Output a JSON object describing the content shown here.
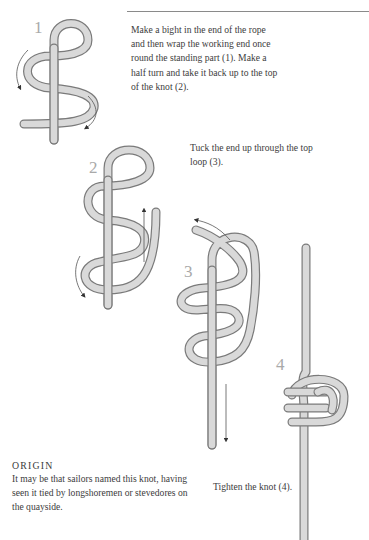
{
  "instructions": {
    "step_1_2": "Make a bight in the end of the rope and then wrap the working end once round the standing part (1). Make a half turn and take it back up to the top of the knot (2).",
    "step_3": "Tuck the end up through the top loop (3).",
    "step_4": "Tighten the knot (4)."
  },
  "origin": {
    "title": "ORIGIN",
    "body": "It may be that sailors named this knot, having seen it tied by longshoremen or stevedores on the quayside."
  },
  "diagrams": [
    {
      "number": "1"
    },
    {
      "number": "2"
    },
    {
      "number": "3"
    },
    {
      "number": "4"
    }
  ],
  "colors": {
    "rope_fill": "#d9d9d9",
    "rope_outline": "#7a7a7a",
    "step_number": "#a9a9a9",
    "text": "#3c3c3c"
  }
}
